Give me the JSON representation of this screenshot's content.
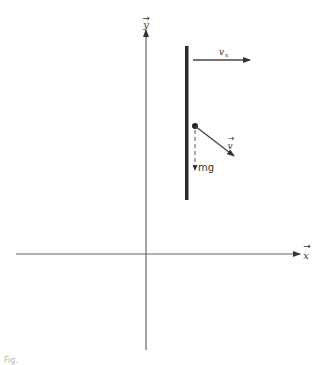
{
  "diagram": {
    "axes": {
      "x_label": "x",
      "y_label": "y",
      "x_vector_mark": "→",
      "y_vector_mark": "→"
    },
    "rod": {
      "description": "vertical rod / wall"
    },
    "vectors": [
      {
        "id": "vx",
        "label": "v",
        "subscript": "x",
        "vector_mark": "→",
        "direction": "right"
      },
      {
        "id": "v",
        "label": "v",
        "vector_mark": "→",
        "direction": "down-right"
      },
      {
        "id": "mg",
        "label": "mg",
        "direction": "down"
      }
    ],
    "point": {
      "description": "particle at start of velocity vector"
    }
  },
  "caption": "Fig."
}
